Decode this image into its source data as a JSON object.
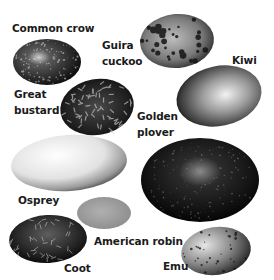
{
  "figure": {
    "eggs": [
      {
        "id": "common-crow",
        "label": "Common crow",
        "pattern": "dark speckled",
        "base_color": "#2a2a2a"
      },
      {
        "id": "guira-cuckoo",
        "label_lines": [
          "Guira",
          "cuckoo"
        ],
        "pattern": "blotched",
        "base_color": "#5a5a5a"
      },
      {
        "id": "kiwi",
        "label": "Kiwi",
        "pattern": "mottled pale",
        "base_color": "#8a8a8a"
      },
      {
        "id": "great-bustard",
        "label_lines": [
          "Great",
          "bustard"
        ],
        "pattern": "streaked",
        "base_color": "#1e1e1e"
      },
      {
        "id": "golden-plover",
        "label_lines": [
          "Golden",
          "plover"
        ],
        "pattern": "dark speckled",
        "base_color": "#121212"
      },
      {
        "id": "osprey",
        "label": "Osprey",
        "pattern": "pale with dark end",
        "base_color": "#e8e8e8"
      },
      {
        "id": "american-robin",
        "label": "American robin",
        "pattern": "plain",
        "base_color": "#9a9a9a"
      },
      {
        "id": "coot",
        "label": "Coot",
        "pattern": "dark marbled",
        "base_color": "#151515"
      },
      {
        "id": "emu",
        "label": "Emu",
        "pattern": "spotted",
        "base_color": "#6e6e6e"
      }
    ]
  }
}
